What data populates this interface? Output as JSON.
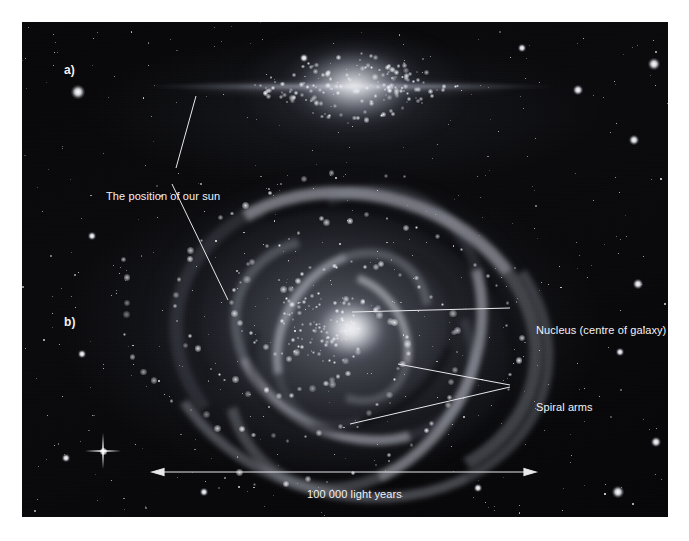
{
  "figure": {
    "type": "astronomy-diagram",
    "panels": [
      {
        "id": "a",
        "label": "a)",
        "view": "edge-on view of the galactic disk and central bulge"
      },
      {
        "id": "b",
        "label": "b)",
        "view": "face-on view showing spiral arms and nucleus"
      }
    ]
  },
  "annotations": {
    "sun": "The position of our sun",
    "nucleus": "Nucleus (centre of galaxy)",
    "spiral_arms": "Spiral arms",
    "scale": "100 000 light years"
  },
  "scale_bar": {
    "value": "100 000",
    "unit": "light years",
    "left_x": 152,
    "right_x": 530,
    "y": 472,
    "style": "double-headed-arrow"
  },
  "colors": {
    "page_background": "#ffffff",
    "plate_background": "#050507",
    "label_text": "#f2f2f4",
    "leader_line": "#e8e8ec",
    "star": "#ffffff"
  },
  "leader_lines": [
    {
      "name": "sun-to-edge-on-disk",
      "from": [
        176,
        168
      ],
      "to": [
        196,
        96
      ]
    },
    {
      "name": "sun-to-spiral-arm",
      "from": [
        172,
        184
      ],
      "to": [
        228,
        300
      ]
    },
    {
      "name": "nucleus-to-core",
      "from": [
        510,
        308
      ],
      "to": [
        352,
        312
      ]
    },
    {
      "name": "arms-upper",
      "from": [
        510,
        385
      ],
      "to": [
        398,
        364
      ]
    },
    {
      "name": "arms-lower",
      "from": [
        510,
        387
      ],
      "to": [
        350,
        424
      ]
    }
  ]
}
